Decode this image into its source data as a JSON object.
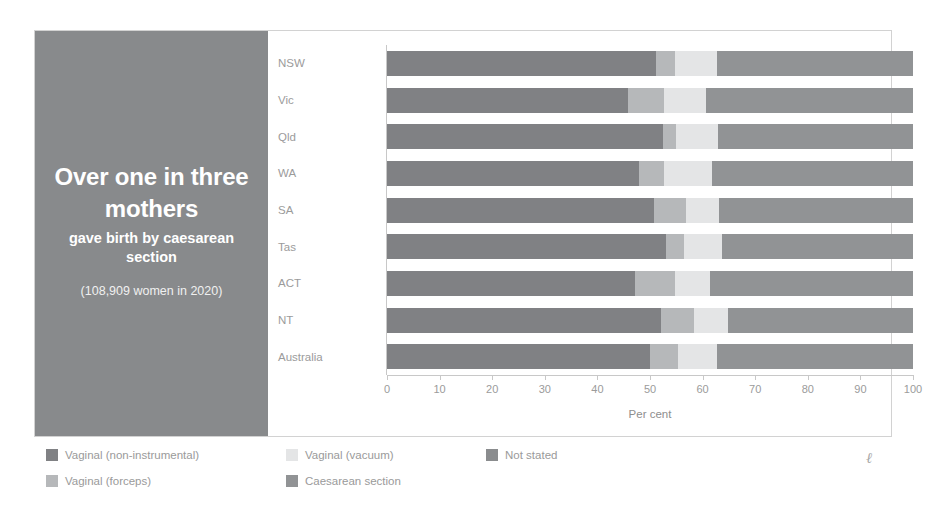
{
  "caption": {
    "headline": "Over one in three mothers",
    "subtitle": "gave birth by caesarean section",
    "note": "(108,909 women in 2020)",
    "panel_color": "#888a8c"
  },
  "chart_data": {
    "type": "bar",
    "orientation": "horizontal",
    "stacked": true,
    "title": "",
    "xlabel": "Per cent",
    "ylabel": "",
    "xlim": [
      0,
      100
    ],
    "xticks": [
      "0",
      "10",
      "20",
      "30",
      "40",
      "50",
      "60",
      "70",
      "80",
      "90",
      "100"
    ],
    "grid": false,
    "legend_position": "bottom",
    "categories": [
      "NSW",
      "Vic",
      "Qld",
      "WA",
      "SA",
      "Tas",
      "ACT",
      "NT",
      "Australia"
    ],
    "series": [
      {
        "name": "Vaginal (non-instrumental)",
        "color": "#808184",
        "values": [
          51.2,
          45.8,
          52.5,
          47.9,
          50.8,
          53.0,
          47.1,
          52.0,
          50.0
        ]
      },
      {
        "name": "Vaginal (forceps)",
        "color": "#b6b8ba",
        "values": [
          3.5,
          6.9,
          2.5,
          4.8,
          6.1,
          3.5,
          7.7,
          6.3,
          5.4
        ]
      },
      {
        "name": "Vaginal (vacuum)",
        "color": "#e4e5e6",
        "values": [
          8.0,
          8.0,
          8.0,
          9.0,
          6.3,
          7.2,
          6.7,
          6.5,
          7.3
        ]
      },
      {
        "name": "Caesarean section",
        "color": "#919395",
        "values": [
          37.3,
          39.3,
          37.0,
          38.3,
          36.8,
          36.3,
          38.5,
          35.2,
          37.3
        ]
      },
      {
        "name": "Not stated",
        "color": "#8a8c8e",
        "values": [
          0,
          0,
          0,
          0,
          0,
          0,
          0,
          0,
          0
        ]
      }
    ],
    "legend": [
      {
        "label": "Vaginal (non-instrumental)",
        "color": "#808184"
      },
      {
        "label": "Vaginal (forceps)",
        "color": "#b6b8ba"
      },
      {
        "label": "Vaginal (vacuum)",
        "color": "#e4e5e6"
      },
      {
        "label": "Caesarean section",
        "color": "#919395"
      },
      {
        "label": "Not stated",
        "color": "#8a8c8e"
      }
    ]
  },
  "signature": "ℓ"
}
